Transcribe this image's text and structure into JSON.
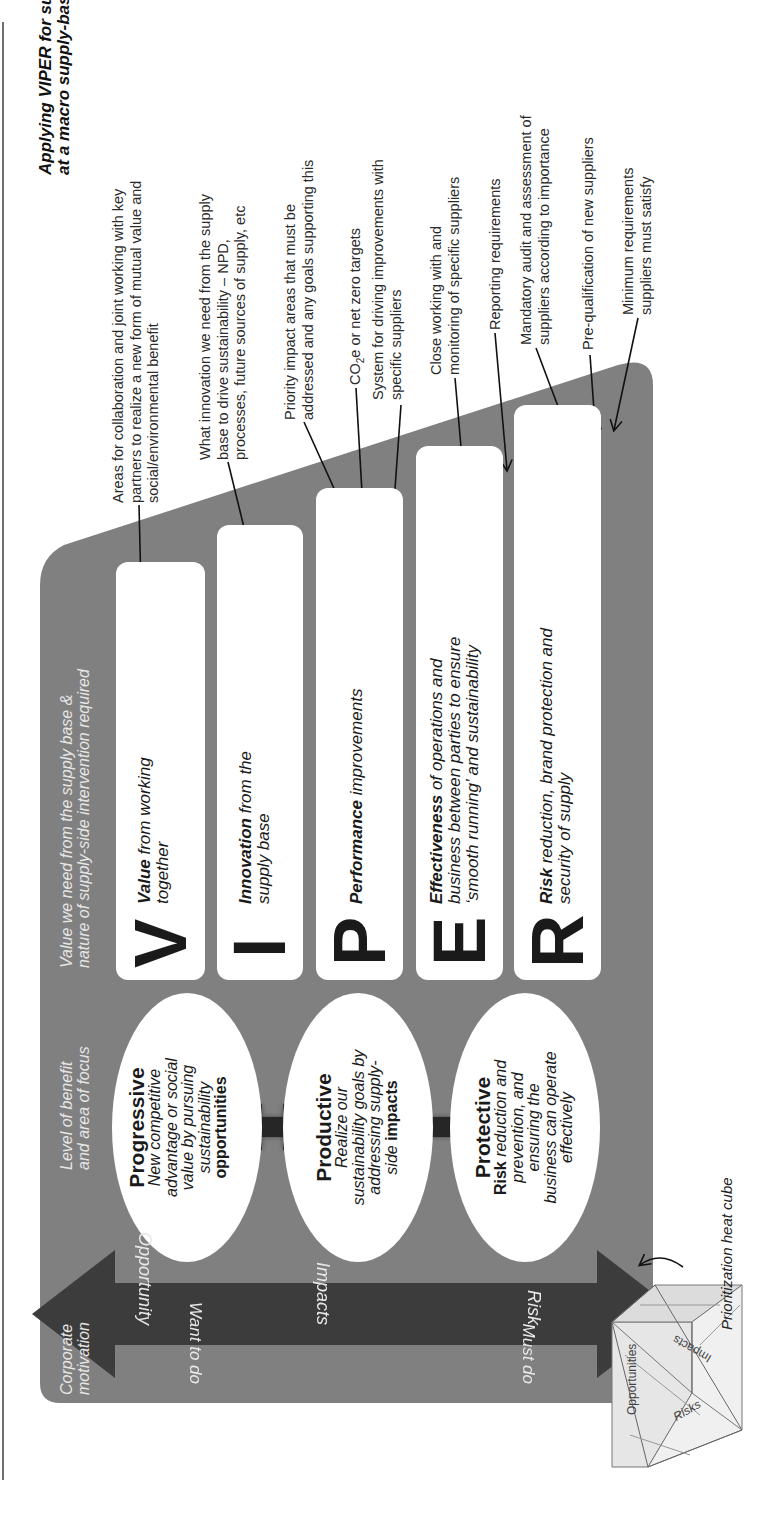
{
  "title": {
    "line1": "Applying VIPER for sustainable procurement",
    "line2": "at a macro supply-base-wide level"
  },
  "headers": {
    "corporate_motivation": [
      "Corporate",
      "motivation"
    ],
    "level_of_benefit": [
      "Level of benefit",
      "and area of focus"
    ],
    "value_needed": [
      "Value we need from the supply base &",
      "nature of supply-side intervention required"
    ]
  },
  "viper": [
    {
      "letter": "V",
      "bold": "Value",
      "rest": " from working",
      "line2": "together"
    },
    {
      "letter": "I",
      "bold": "Innovation",
      "rest": " from the",
      "line2": "supply base"
    },
    {
      "letter": "P",
      "bold": "Performance",
      "rest": " improvements",
      "line2": ""
    },
    {
      "letter": "E",
      "bold": "Effectiveness",
      "rest": " of operations and",
      "line2": "business between parties to ensure",
      "line3": "‘smooth running’ and sustainability"
    },
    {
      "letter": "R",
      "bold": "Risk",
      "rest": " reduction, brand protection and",
      "line2": "security of supply"
    }
  ],
  "levels": [
    {
      "heading": "Progressive",
      "lines": [
        "New competitive",
        "advantage or social",
        "value by pursuing",
        "sustainability"
      ],
      "bold_line": "opportunities"
    },
    {
      "heading": "Productive",
      "lines": [
        "Realize our",
        "sustainability goals by",
        "addressing supply-"
      ],
      "last_plain": "side ",
      "last_bold": "impacts"
    },
    {
      "heading": "Protective",
      "first_bold": "Risk",
      "first_rest": " reduction and",
      "lines": [
        "prevention, and",
        "ensuring the",
        "business can operate",
        "effectively"
      ]
    }
  ],
  "motivation_arrow": {
    "opportunity": "Opportunity",
    "impacts": "Impacts",
    "risk": "Risk",
    "want_to_do": "Want to do",
    "must_do": "Must do"
  },
  "annotations": {
    "value": [
      "Areas for collaboration and joint working with key",
      "partners to realize a new form of mutual value and",
      "social/environmental benefit"
    ],
    "innovation": [
      "What innovation we need from the supply",
      "base to drive sustainability – NPD,",
      "processes, future sources of supply, etc"
    ],
    "performance_1": [
      "Priority impact areas that must be",
      "addressed and any goals supporting this"
    ],
    "performance_2": {
      "pre": "CO",
      "sub": "2",
      "post": "e or net zero targets"
    },
    "performance_3": [
      "System for driving improvements with",
      "specific suppliers"
    ],
    "effectiveness_1": [
      "Close working with and",
      "monitoring of specific suppliers"
    ],
    "effectiveness_2": [
      "Reporting requirements"
    ],
    "risk_1": [
      "Mandatory audit and assessment of",
      "suppliers according to importance"
    ],
    "risk_2": [
      "Pre-qualification of new suppliers"
    ],
    "risk_3": [
      "Minimum requirements",
      "suppliers must satisfy"
    ]
  },
  "cube": {
    "labels": {
      "opportunities": "Opportunities",
      "impacts": "Impacts",
      "risks": "Risks"
    },
    "caption": "Prioritization heat cube"
  },
  "colors": {
    "panel": "#808080",
    "dark_arrow": "#3c3c3c",
    "box": "#ffffff",
    "header_text": "#e6e6e6"
  }
}
